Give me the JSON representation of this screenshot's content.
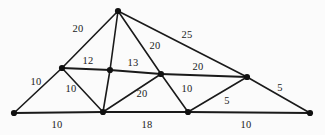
{
  "figure": {
    "background_color": "#fbfbfb",
    "line_color": "#1a1a1a",
    "vertex_color": "#111111",
    "width": 325,
    "height": 135
  },
  "graph_data": {
    "type": "node-link-diagram",
    "directed": false,
    "weighted": true,
    "nodes": [
      {
        "id": "A",
        "label": "",
        "x": 14,
        "y": 113,
        "name": "vertex-bottom-left"
      },
      {
        "id": "B",
        "label": "",
        "x": 62,
        "y": 68,
        "name": "vertex-upper-left"
      },
      {
        "id": "C",
        "label": "",
        "x": 118,
        "y": 11,
        "name": "vertex-apex"
      },
      {
        "id": "D",
        "label": "",
        "x": 110,
        "y": 70,
        "name": "vertex-center-left"
      },
      {
        "id": "E",
        "label": "",
        "x": 103,
        "y": 112,
        "name": "vertex-bottom-center-left"
      },
      {
        "id": "F",
        "label": "",
        "x": 161,
        "y": 74,
        "name": "vertex-center-right"
      },
      {
        "id": "G",
        "label": "",
        "x": 188,
        "y": 112,
        "name": "vertex-bottom-center-right"
      },
      {
        "id": "H",
        "label": "",
        "x": 247,
        "y": 77,
        "name": "vertex-upper-right"
      },
      {
        "id": "I",
        "label": "",
        "x": 310,
        "y": 113,
        "name": "vertex-bottom-right"
      }
    ],
    "edges": [
      {
        "source": "A",
        "target": "B",
        "weight": 10,
        "label_x": 36,
        "label_y": 81,
        "name": "edge-A-B"
      },
      {
        "source": "A",
        "target": "E",
        "weight": 10,
        "label_x": 57,
        "label_y": 124,
        "name": "edge-A-E"
      },
      {
        "source": "B",
        "target": "C",
        "weight": 20,
        "label_x": 78,
        "label_y": 28,
        "name": "edge-B-C"
      },
      {
        "source": "B",
        "target": "D",
        "weight": 12,
        "label_x": 88,
        "label_y": 60,
        "name": "edge-B-D"
      },
      {
        "source": "B",
        "target": "E",
        "weight": 10,
        "label_x": 71,
        "label_y": 88,
        "name": "edge-B-E"
      },
      {
        "source": "C",
        "target": "D",
        "weight": null,
        "label_x": null,
        "label_y": null,
        "name": "edge-C-D"
      },
      {
        "source": "C",
        "target": "F",
        "weight": 20,
        "label_x": 155,
        "label_y": 45,
        "name": "edge-C-F"
      },
      {
        "source": "C",
        "target": "H",
        "weight": 25,
        "label_x": 187,
        "label_y": 34,
        "name": "edge-C-H"
      },
      {
        "source": "D",
        "target": "E",
        "weight": null,
        "label_x": null,
        "label_y": null,
        "name": "edge-D-E"
      },
      {
        "source": "D",
        "target": "F",
        "weight": 13,
        "label_x": 133,
        "label_y": 62,
        "name": "edge-D-F"
      },
      {
        "source": "E",
        "target": "F",
        "weight": 20,
        "label_x": 142,
        "label_y": 93,
        "name": "edge-E-F"
      },
      {
        "source": "E",
        "target": "G",
        "weight": 18,
        "label_x": 147,
        "label_y": 124,
        "name": "edge-E-G"
      },
      {
        "source": "F",
        "target": "G",
        "weight": 10,
        "label_x": 187,
        "label_y": 88,
        "name": "edge-F-G"
      },
      {
        "source": "F",
        "target": "H",
        "weight": 20,
        "label_x": 198,
        "label_y": 66,
        "name": "edge-F-H"
      },
      {
        "source": "G",
        "target": "H",
        "weight": 5,
        "label_x": 227,
        "label_y": 100,
        "name": "edge-G-H"
      },
      {
        "source": "G",
        "target": "I",
        "weight": 10,
        "label_x": 246,
        "label_y": 124,
        "name": "edge-G-I"
      },
      {
        "source": "H",
        "target": "I",
        "weight": 5,
        "label_x": 280,
        "label_y": 87,
        "name": "edge-H-I"
      }
    ],
    "thick_edges": [
      {
        "source": "A",
        "target": "E"
      },
      {
        "source": "E",
        "target": "G"
      },
      {
        "source": "G",
        "target": "I"
      },
      {
        "source": "B",
        "target": "D"
      },
      {
        "source": "D",
        "target": "F"
      },
      {
        "source": "F",
        "target": "H"
      }
    ],
    "vertex_radius": 3.1
  }
}
